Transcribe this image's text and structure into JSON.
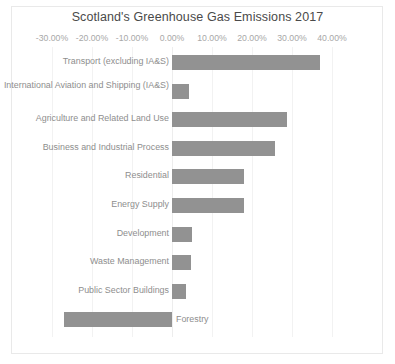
{
  "chart": {
    "title": "Scotland's Greenhouse Gas Emissions 2017"
  },
  "chart_data": {
    "type": "bar",
    "orientation": "horizontal",
    "title": "Scotland's Greenhouse Gas Emissions 2017",
    "xlabel": "",
    "ylabel": "",
    "xlim": [
      -30.0,
      40.0
    ],
    "xtick_labels": [
      "-30.00%",
      "-20.00%",
      "-10.00%",
      "0.00%",
      "10.00%",
      "20.00%",
      "30.00%",
      "40.00%"
    ],
    "xticks": [
      -30,
      -20,
      -10,
      0,
      10,
      20,
      30,
      40
    ],
    "grid": true,
    "legend": false,
    "value_unit": "%",
    "categories": [
      "Transport (excluding IA&S)",
      "International Aviation and Shipping (IA&S)",
      "Agriculture and Related Land Use",
      "Business and Industrial Process",
      "Residential",
      "Energy Supply",
      "Development",
      "Waste Management",
      "Public Sector Buildings",
      "Forestry"
    ],
    "values": [
      37.0,
      4.3,
      28.7,
      25.8,
      18.0,
      18.0,
      5.0,
      4.7,
      3.5,
      -27.0
    ],
    "bar_color": "#929292"
  }
}
